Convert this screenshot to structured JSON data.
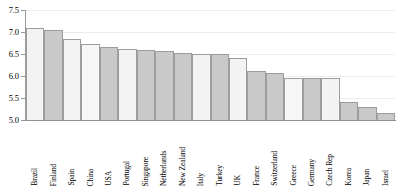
{
  "chart_data": {
    "type": "bar",
    "title": "",
    "subtitle": "",
    "xlabel": "",
    "ylabel": "",
    "ylim": [
      5.0,
      7.5
    ],
    "yticks": [
      "5.0",
      "5.5",
      "6.0",
      "6.5",
      "7.0",
      "7.5"
    ],
    "ytick_values": [
      5.0,
      5.5,
      6.0,
      6.5,
      7.0,
      7.5
    ],
    "grid": true,
    "legend": false,
    "legend_position": "none",
    "orientation": "vertical",
    "categories": [
      "Brazil",
      "Finland",
      "Spain",
      "China",
      "USA",
      "Portugal",
      "Singapore",
      "Netherlands",
      "New Zealand",
      "Italy",
      "Turkey",
      "UK",
      "France",
      "Switzerland",
      "Greece",
      "Germany",
      "Czech Rep",
      "Korea",
      "Japan",
      "Israel"
    ],
    "values": [
      7.1,
      7.05,
      6.85,
      6.72,
      6.67,
      6.62,
      6.6,
      6.56,
      6.53,
      6.51,
      6.5,
      6.4,
      6.11,
      6.07,
      5.95,
      5.95,
      5.95,
      5.4,
      5.3,
      5.15
    ],
    "bar_fills": [
      "#f3f3f3",
      "#c9c9c9",
      "#f3f3f3",
      "#f6f6f6",
      "#c9c9c9",
      "#f3f3f3",
      "#c9c9c9",
      "#c9c9c9",
      "#c9c9c9",
      "#f3f3f3",
      "#c9c9c9",
      "#f3f3f3",
      "#c9c9c9",
      "#c9c9c9",
      "#f6f6f6",
      "#c9c9c9",
      "#f3f3f3",
      "#c9c9c9",
      "#c9c9c9",
      "#c9c9c9"
    ],
    "bar_edge_color": "#9d9d9d",
    "axis_color": "#8f8f8f",
    "gridline_color": "#ececec",
    "background_color": "#ffffff",
    "text_color": "#000000"
  }
}
